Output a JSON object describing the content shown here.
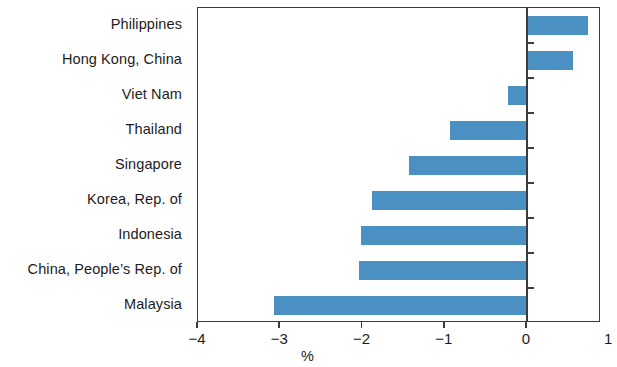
{
  "chart_data": {
    "type": "bar",
    "orientation": "horizontal",
    "title": "",
    "subtitle": "",
    "xlabel": "%",
    "ylabel": "",
    "xlim": [
      -4,
      0.9
    ],
    "xticks": [
      -4,
      -3,
      -2,
      -1,
      0,
      1
    ],
    "xticklabels": [
      "−4",
      "−3",
      "−2",
      "−1",
      "0",
      "1"
    ],
    "grid": false,
    "legend": null,
    "series_color": "#4a90c2",
    "axis_color": "#3b3b3b",
    "categories": [
      "Philippines",
      "Hong Kong, China",
      "Viet Nam",
      "Thailand",
      "Singapore",
      "Korea, Rep. of",
      "Indonesia",
      "China, People’s Rep. of",
      "Malaysia"
    ],
    "values": [
      0.74,
      0.56,
      -0.23,
      -0.94,
      -1.43,
      -1.89,
      -2.02,
      -2.04,
      -3.07
    ]
  }
}
